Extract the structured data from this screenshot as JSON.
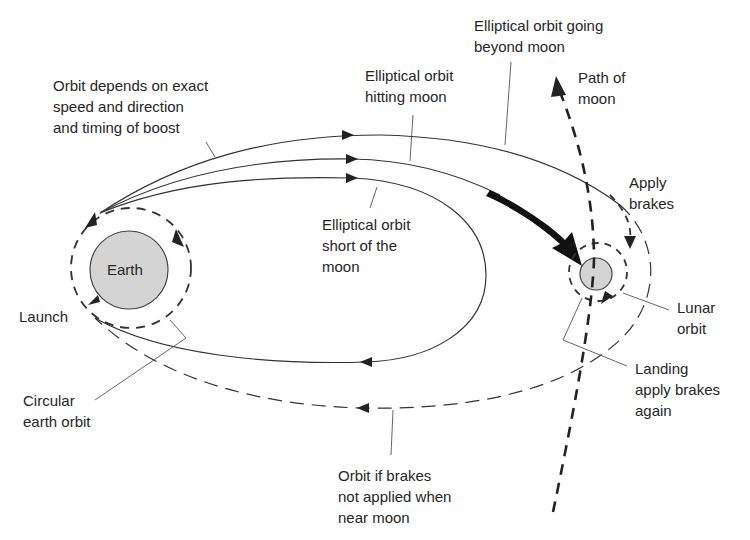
{
  "diagram": {
    "colors": {
      "line": "#333333",
      "planet_fill": "#d4d4d4",
      "planet_stroke": "#444444",
      "text": "#262626",
      "background": "#ffffff"
    },
    "bodies": {
      "earth": {
        "label": "Earth"
      },
      "moon": {
        "label": ""
      }
    },
    "labels": {
      "orbit_depends": "Orbit depends on exact\nspeed and direction\nand timing of boost",
      "elliptical_hitting": "Elliptical orbit\nhitting moon",
      "elliptical_beyond": "Elliptical orbit going\nbeyond moon",
      "path_of_moon": "Path of\nmoon",
      "apply_brakes": "Apply\nbrakes",
      "elliptical_short": "Elliptical orbit\nshort of the\nmoon",
      "launch": "Launch",
      "circular_earth_orbit": "Circular\nearth orbit",
      "lunar_orbit": "Lunar\norbit",
      "landing": "Landing\napply brakes\nagain",
      "orbit_no_brakes": "Orbit if brakes\nnot applied when\nnear moon"
    },
    "paths": [
      {
        "name": "circular-earth-orbit",
        "style": "dashed"
      },
      {
        "name": "elliptical-orbit-beyond-moon",
        "style": "solid"
      },
      {
        "name": "elliptical-orbit-hitting-moon",
        "style": "solid"
      },
      {
        "name": "elliptical-orbit-short-of-moon",
        "style": "solid"
      },
      {
        "name": "orbit-if-brakes-not-applied",
        "style": "dashed"
      },
      {
        "name": "path-of-moon",
        "style": "bold-dashed"
      },
      {
        "name": "lunar-orbit",
        "style": "dashed"
      },
      {
        "name": "approach-arrow",
        "style": "bold-filled"
      }
    ]
  }
}
